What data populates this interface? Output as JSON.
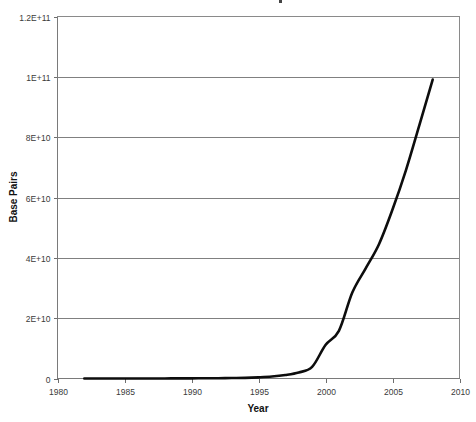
{
  "chart_data": {
    "type": "line",
    "title": "",
    "xlabel": "Year",
    "ylabel": "Base Pairs",
    "xlim": [
      1980,
      2010
    ],
    "ylim": [
      0,
      120000000000
    ],
    "grid": true,
    "legend": false,
    "x_tick_labels": [
      "1980",
      "1985",
      "1990",
      "1995",
      "2000",
      "2005",
      "2010"
    ],
    "x_ticks": [
      1980,
      1985,
      1990,
      1995,
      2000,
      2005,
      2010
    ],
    "y_tick_labels": [
      "0",
      "2E+10",
      "4E+10",
      "6E+10",
      "8E+10",
      "1E+11",
      "1.2E+11"
    ],
    "y_ticks": [
      0,
      20000000000,
      40000000000,
      60000000000,
      80000000000,
      100000000000,
      120000000000
    ],
    "series": [
      {
        "name": "Base Pairs",
        "color": "#0d0d0d",
        "x": [
          1982,
          1983,
          1984,
          1985,
          1986,
          1987,
          1988,
          1989,
          1990,
          1991,
          1992,
          1993,
          1994,
          1995,
          1996,
          1997,
          1998,
          1999,
          2000,
          2001,
          2002,
          2003,
          2004,
          2005,
          2006,
          2007,
          2008
        ],
        "values": [
          680000,
          2270000,
          3000000,
          5700000,
          9600000,
          15500000,
          23800000,
          34800000,
          49200000,
          71900000,
          101000000,
          157000000,
          217000000,
          384000000,
          651000000,
          1160000000,
          2010000000,
          3840000000,
          11100000000,
          15800000000,
          28500000000,
          36500000000,
          44600000000,
          56000000000,
          69000000000,
          83900000000,
          99100000000
        ]
      }
    ],
    "annotations": []
  },
  "axes": {
    "y_axis_title": "Base Pairs",
    "x_axis_title": "Year"
  },
  "ticks": {
    "y": [
      {
        "label": "1.2E+11",
        "value": 120000000000
      },
      {
        "label": "1E+11",
        "value": 100000000000
      },
      {
        "label": "8E+10",
        "value": 80000000000
      },
      {
        "label": "6E+10",
        "value": 60000000000
      },
      {
        "label": "4E+10",
        "value": 40000000000
      },
      {
        "label": "2E+10",
        "value": 20000000000
      },
      {
        "label": "0",
        "value": 0
      }
    ],
    "x": [
      {
        "label": "1980",
        "value": 1980
      },
      {
        "label": "1985",
        "value": 1985
      },
      {
        "label": "1990",
        "value": 1990
      },
      {
        "label": "1995",
        "value": 1995
      },
      {
        "label": "2000",
        "value": 2000
      },
      {
        "label": "2005",
        "value": 2005
      },
      {
        "label": "2010",
        "value": 2010
      }
    ]
  },
  "colors": {
    "series": "#0d0d0d",
    "grid": "#808080",
    "axis": "#7a7a7a",
    "text": "#3a3a3a",
    "background": "#ffffff"
  }
}
